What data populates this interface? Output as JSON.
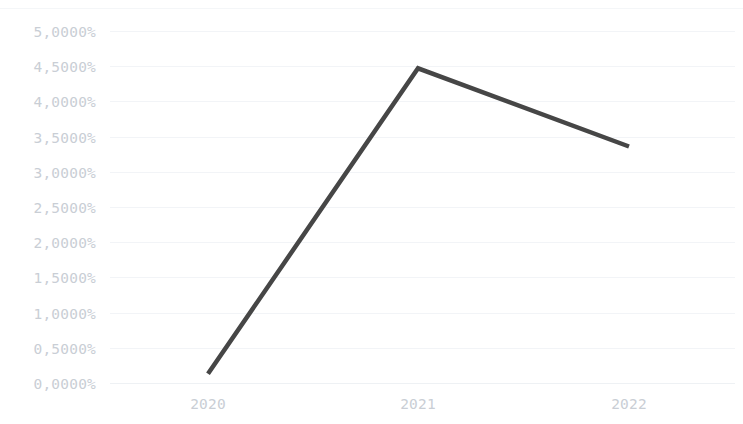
{
  "chart_data": {
    "type": "line",
    "title": "",
    "subtitle": "",
    "xlabel": "",
    "ylabel": "",
    "categories": [
      "2020",
      "2021",
      "2022"
    ],
    "x": [
      2020,
      2021,
      2022
    ],
    "series": [
      {
        "name": "",
        "values": [
          0.13,
          4.47,
          3.36
        ],
        "color": "#464646",
        "line_width": 4.5,
        "markers": false
      }
    ],
    "y_tick_labels": [
      "5,0000%",
      "4,5000%",
      "4,0000%",
      "3,5000%",
      "3,0000%",
      "2,5000%",
      "2,0000%",
      "1,5000%",
      "1,0000%",
      "0,5000%",
      "0,0000%"
    ],
    "y_tick_values": [
      5.0,
      4.5,
      4.0,
      3.5,
      3.0,
      2.5,
      2.0,
      1.5,
      1.0,
      0.5,
      0.0
    ],
    "x_tick_labels": [
      "2020",
      "2021",
      "2022"
    ],
    "ylim": [
      0.0,
      5.0
    ],
    "y_tick_step": 0.5,
    "value_format": "percent-comma-4dp",
    "grid": {
      "horizontal": true,
      "vertical": false,
      "color": "#f2f4f7"
    },
    "legend": {
      "visible": false,
      "position": "none"
    },
    "colors": {
      "background": "#ffffff",
      "grid": "#f2f4f7",
      "tick_label": "#c9ced5",
      "line": "#464646",
      "frame": "#f4f6f8"
    },
    "geometry": {
      "plot_left": 110,
      "plot_right": 735,
      "plot_top": 31,
      "plot_bottom": 383,
      "x_positions": [
        208,
        418,
        629
      ]
    }
  }
}
